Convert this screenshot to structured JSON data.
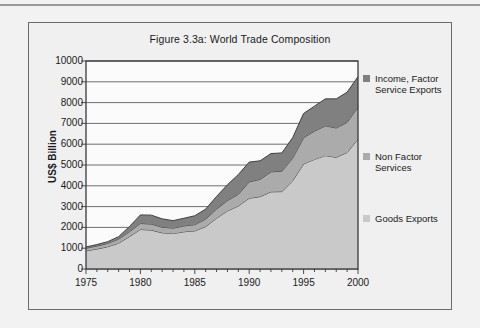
{
  "figure": {
    "title": "Figure 3.3a: World Trade Composition",
    "frame_border_color": "#6b6b6b",
    "background_color": "#f0f0f0"
  },
  "axes": {
    "y_axis_title": "US$ Billion",
    "y_ticks": [
      "0",
      "1000",
      "2000",
      "3000",
      "4000",
      "5000",
      "6000",
      "7000",
      "8000",
      "9000",
      "10000"
    ],
    "x_ticks": [
      "1975",
      "1980",
      "1985",
      "1990",
      "1995",
      "2000"
    ]
  },
  "legend": {
    "items": [
      {
        "label": "Income, Factor\nService Exports",
        "color": "#808080"
      },
      {
        "label": "Non Factor\nServices",
        "color": "#ababab"
      },
      {
        "label": "Goods Exports",
        "color": "#c9c9c9"
      }
    ]
  },
  "chart_data": {
    "type": "area",
    "stacked": true,
    "title": "Figure 3.3a: World Trade Composition",
    "xlabel": "",
    "ylabel": "US$ Billion",
    "xlim": [
      1975,
      2000
    ],
    "ylim": [
      0,
      10000
    ],
    "y_tick_step": 1000,
    "grid": true,
    "legend_position": "right",
    "x": [
      1975,
      1976,
      1977,
      1978,
      1979,
      1980,
      1981,
      1982,
      1983,
      1984,
      1985,
      1986,
      1987,
      1988,
      1989,
      1990,
      1991,
      1992,
      1993,
      1994,
      1995,
      1996,
      1997,
      1998,
      1999,
      2000
    ],
    "series": [
      {
        "name": "Goods Exports",
        "values": [
          870,
          960,
          1070,
          1240,
          1560,
          1900,
          1870,
          1740,
          1700,
          1790,
          1830,
          2040,
          2440,
          2790,
          3030,
          3400,
          3480,
          3710,
          3720,
          4240,
          5050,
          5270,
          5450,
          5370,
          5600,
          6250
        ]
      },
      {
        "name": "Non Factor Services",
        "values": [
          130,
          145,
          160,
          195,
          235,
          290,
          290,
          270,
          265,
          280,
          300,
          360,
          440,
          500,
          560,
          790,
          830,
          960,
          980,
          1090,
          1260,
          1360,
          1430,
          1410,
          1450,
          1530
        ]
      },
      {
        "name": "Income, Factor Service Exports",
        "values": [
          60,
          70,
          85,
          120,
          250,
          410,
          430,
          400,
          360,
          370,
          430,
          480,
          610,
          760,
          950,
          950,
          890,
          880,
          880,
          990,
          1170,
          1200,
          1300,
          1400,
          1450,
          1470
        ]
      }
    ]
  }
}
